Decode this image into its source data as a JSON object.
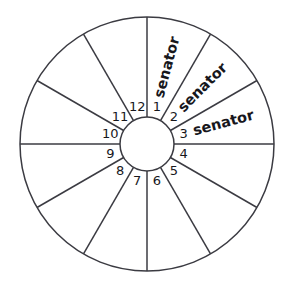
{
  "diagram": {
    "background_color": "#ffffff",
    "line_color": "#3b3b42",
    "text_color": "#17171c",
    "geometry": {
      "center_x": 147,
      "center_y": 144,
      "outer_radius": 127,
      "hub_radius": 27,
      "sector_count": 12,
      "sector_angle_degrees": 30,
      "first_spoke_angle_degrees": -90
    },
    "sectors": [
      {
        "number": "1",
        "label": "senator",
        "angle_degrees": -75
      },
      {
        "number": "2",
        "label": "senator",
        "angle_degrees": -45
      },
      {
        "number": "3",
        "label": "senator",
        "angle_degrees": -15
      },
      {
        "number": "4",
        "label": "",
        "angle_degrees": 15
      },
      {
        "number": "5",
        "label": "",
        "angle_degrees": 45
      },
      {
        "number": "6",
        "label": "",
        "angle_degrees": 75
      },
      {
        "number": "7",
        "label": "",
        "angle_degrees": 105
      },
      {
        "number": "8",
        "label": "",
        "angle_degrees": 135
      },
      {
        "number": "9",
        "label": "",
        "angle_degrees": 165
      },
      {
        "number": "10",
        "label": "",
        "angle_degrees": 195
      },
      {
        "number": "11",
        "label": "",
        "angle_degrees": 225
      },
      {
        "number": "12",
        "label": "",
        "angle_degrees": 255
      }
    ]
  }
}
